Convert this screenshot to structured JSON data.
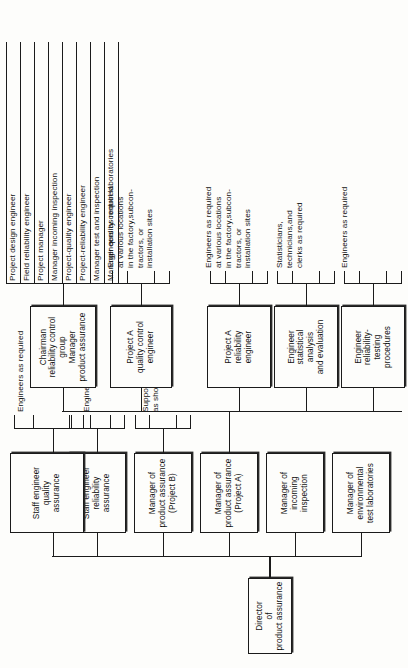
{
  "diagram": {
    "orientation": "rotated-90",
    "root": {
      "label": "Director\nof\nproduct assurance"
    },
    "level1": [
      {
        "label": "Manager of\nenvironmental\ntest laboratories"
      },
      {
        "label": "Manager of\nincoming\ninspection"
      },
      {
        "label": "Manager of\nproduct assurance\n(Project A)"
      },
      {
        "label": "Manager of\nproduct assurance\n(Project B)"
      },
      {
        "label": "Staff engineer\nreliability\nassurance"
      },
      {
        "label": "Staff engineer\nquality\nassurance"
      }
    ],
    "notes": {
      "staff_reliability": "Engineers as required",
      "staff_quality": "Engineers as required",
      "project_b": "Supporting structure\nas shown for project A",
      "engineer_reliability_testing": "Engineers as required",
      "engineer_statistical": "Statisticians,\ntechnicians,and\nclerks as required",
      "project_a_reliability": "Engineers as required\nat various locations\nin the factory,subcon-\ntractors, or\ninstallation sites",
      "project_a_quality": "Engineers as required\nat various locations\nin the factory,subcon-\ntractors, or\ninstallation sites"
    },
    "project_a_children": [
      {
        "label": "Engineer\nreliability-\ntesting\nprocedures"
      },
      {
        "label": "Engineer\nstatistical\nanalysis\nand evaluation"
      },
      {
        "label": "Project A\nreliability\nengineer"
      },
      {
        "label": "Project A\nquality control\nengineer"
      },
      {
        "label": "Chairman\nreliability control group\nManager\nproduct assurance"
      }
    ],
    "committee_members": [
      "Project design engineer",
      "Field reliability engineer",
      "Project manager",
      "Manager incoming inspection",
      "Project-quality engineer",
      "Project-reliability engineer",
      "Manager test and inspection",
      "Manager quality control laboratories"
    ]
  }
}
